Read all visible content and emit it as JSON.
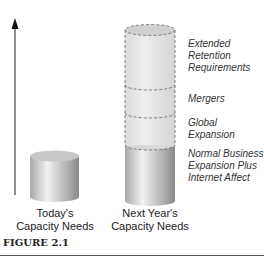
{
  "diagram": {
    "figure_label": "FIGURE 2.1",
    "left_cylinder": {
      "caption_line1": "Today's",
      "caption_line2": "Capacity Needs"
    },
    "right_cylinder": {
      "caption_line1": "Next Year's",
      "caption_line2": "Capacity Needs",
      "segments": [
        {
          "label": [
            "Extended",
            "Retention",
            "Requirements"
          ],
          "style": "dashed"
        },
        {
          "label": [
            "Mergers"
          ],
          "style": "dashed"
        },
        {
          "label": [
            "Global",
            "Expansion"
          ],
          "style": "dashed"
        },
        {
          "label": [
            "Normal Business",
            "Expansion Plus",
            "Internet Affect"
          ],
          "style": "solid"
        }
      ]
    },
    "axis": {
      "direction": "up-arrow"
    }
  }
}
